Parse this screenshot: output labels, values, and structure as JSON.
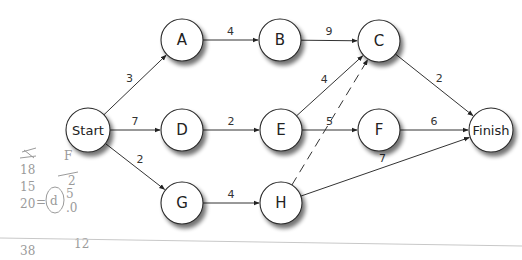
{
  "diagram": {
    "nodes": [
      {
        "id": "start",
        "label": "Start",
        "x": 88,
        "y": 130,
        "r": 22
      },
      {
        "id": "a",
        "label": "A",
        "x": 182,
        "y": 40,
        "r": 21
      },
      {
        "id": "b",
        "label": "B",
        "x": 280,
        "y": 40,
        "r": 21
      },
      {
        "id": "c",
        "label": "C",
        "x": 379,
        "y": 41,
        "r": 21
      },
      {
        "id": "d",
        "label": "D",
        "x": 182,
        "y": 130,
        "r": 21
      },
      {
        "id": "e",
        "label": "E",
        "x": 281,
        "y": 130,
        "r": 21
      },
      {
        "id": "f",
        "label": "F",
        "x": 379,
        "y": 130,
        "r": 21
      },
      {
        "id": "finish",
        "label": "Finish",
        "x": 491,
        "y": 130,
        "r": 22
      },
      {
        "id": "g",
        "label": "G",
        "x": 182,
        "y": 203,
        "r": 21
      },
      {
        "id": "h",
        "label": "H",
        "x": 281,
        "y": 203,
        "r": 21
      }
    ],
    "edges": [
      {
        "from": "start",
        "to": "a",
        "weight": "3",
        "dashed": false
      },
      {
        "from": "start",
        "to": "d",
        "weight": "7",
        "dashed": false
      },
      {
        "from": "start",
        "to": "g",
        "weight": "2",
        "dashed": false
      },
      {
        "from": "a",
        "to": "b",
        "weight": "4",
        "dashed": false
      },
      {
        "from": "b",
        "to": "c",
        "weight": "9",
        "dashed": false
      },
      {
        "from": "d",
        "to": "e",
        "weight": "2",
        "dashed": false
      },
      {
        "from": "e",
        "to": "c",
        "weight": "4",
        "dashed": false
      },
      {
        "from": "e",
        "to": "f",
        "weight": "5",
        "dashed": false
      },
      {
        "from": "g",
        "to": "h",
        "weight": "4",
        "dashed": false
      },
      {
        "from": "h",
        "to": "c",
        "weight": "",
        "dashed": true
      },
      {
        "from": "c",
        "to": "finish",
        "weight": "2",
        "dashed": false
      },
      {
        "from": "f",
        "to": "finish",
        "weight": "6",
        "dashed": false
      },
      {
        "from": "h",
        "to": "finish",
        "weight": "7",
        "dashed": false
      }
    ]
  },
  "handwritten_notes": {
    "left_column": [
      "18",
      "15",
      "20",
      "38"
    ],
    "middle_column_header": "F",
    "middle_column": [
      "2",
      "5",
      ".0",
      "12"
    ],
    "circled": "d",
    "equals": "="
  }
}
